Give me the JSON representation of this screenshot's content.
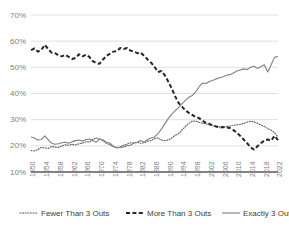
{
  "chart_data": {
    "type": "line",
    "title": "",
    "subtitle": "",
    "xlabel": "",
    "ylabel": "",
    "xlim": [
      1950,
      2022
    ],
    "ylim": [
      10,
      70
    ],
    "ytick_labels": [
      "70%",
      "60%",
      "50%",
      "40%",
      "30%",
      "20%",
      "10%"
    ],
    "ytick_values": [
      70,
      60,
      50,
      40,
      30,
      20,
      10
    ],
    "xtick_labels": [
      "1950",
      "1954",
      "1958",
      "1962",
      "1966",
      "1970",
      "1974",
      "1978",
      "1982",
      "1986",
      "1990",
      "1994",
      "1998",
      "2002",
      "2006",
      "2010",
      "2014",
      "2018",
      "2022"
    ],
    "xtick_values": [
      1950,
      1954,
      1958,
      1962,
      1966,
      1970,
      1974,
      1978,
      1982,
      1986,
      1990,
      1994,
      1998,
      2002,
      2006,
      2010,
      2014,
      2018,
      2022
    ],
    "grid": true,
    "legend_position": "bottom",
    "x": [
      1950,
      1951,
      1952,
      1953,
      1954,
      1955,
      1956,
      1957,
      1958,
      1959,
      1960,
      1961,
      1962,
      1963,
      1964,
      1965,
      1966,
      1967,
      1968,
      1969,
      1970,
      1971,
      1972,
      1973,
      1974,
      1975,
      1976,
      1977,
      1978,
      1979,
      1980,
      1981,
      1982,
      1983,
      1984,
      1985,
      1986,
      1987,
      1988,
      1989,
      1990,
      1991,
      1992,
      1993,
      1994,
      1995,
      1996,
      1997,
      1998,
      1999,
      2000,
      2001,
      2002,
      2003,
      2004,
      2005,
      2006,
      2007,
      2008,
      2009,
      2010,
      2011,
      2012,
      2013,
      2014,
      2015,
      2016,
      2017,
      2018,
      2019,
      2020,
      2021,
      2022
    ],
    "series": [
      {
        "name": "Fewer Than 3 Outs",
        "style": "dotted",
        "color": "#595959",
        "values": [
          18.2,
          18.0,
          18.6,
          19.4,
          19.2,
          19.0,
          19.8,
          19.5,
          19.4,
          20.0,
          20.4,
          20.2,
          20.6,
          20.3,
          20.8,
          21.0,
          21.6,
          21.4,
          22.4,
          23.0,
          22.6,
          22.0,
          21.0,
          20.4,
          19.6,
          19.4,
          19.5,
          20.2,
          20.6,
          21.2,
          21.0,
          21.4,
          21.0,
          21.2,
          21.8,
          22.0,
          22.8,
          23.0,
          22.2,
          22.0,
          22.2,
          23.0,
          24.0,
          24.6,
          26.0,
          27.4,
          28.6,
          29.4,
          29.5,
          29.0,
          28.6,
          28.4,
          28.0,
          27.6,
          27.4,
          27.2,
          27.0,
          27.4,
          27.6,
          27.8,
          28.0,
          28.2,
          28.6,
          29.0,
          29.4,
          29.2,
          28.6,
          28.0,
          27.4,
          26.6,
          26.0,
          25.0,
          23.4
        ]
      },
      {
        "name": "More Than 3 Outs",
        "style": "dashed",
        "color": "#262626",
        "values": [
          56.6,
          57.2,
          56.0,
          56.6,
          58.6,
          57.0,
          55.6,
          55.4,
          54.6,
          54.2,
          54.8,
          54.0,
          53.2,
          53.6,
          55.0,
          54.2,
          54.8,
          54.0,
          52.4,
          51.6,
          51.4,
          53.0,
          54.4,
          55.2,
          56.0,
          56.2,
          57.4,
          57.0,
          57.4,
          56.4,
          56.0,
          55.4,
          55.6,
          54.4,
          53.0,
          51.8,
          50.2,
          48.2,
          48.6,
          47.0,
          44.6,
          42.0,
          39.0,
          36.4,
          35.0,
          33.6,
          32.6,
          31.8,
          31.0,
          30.6,
          29.6,
          28.8,
          28.4,
          27.8,
          27.4,
          27.0,
          27.2,
          27.0,
          26.8,
          26.0,
          25.0,
          23.8,
          22.4,
          21.0,
          19.4,
          18.6,
          19.8,
          21.0,
          22.0,
          22.4,
          22.0,
          23.8,
          22.2
        ]
      },
      {
        "name": "Exactly 3 Outs",
        "style": "solid",
        "color": "#808080",
        "values": [
          23.4,
          23.0,
          22.2,
          22.4,
          23.8,
          22.4,
          21.0,
          20.6,
          20.8,
          21.2,
          21.4,
          21.0,
          21.6,
          22.0,
          22.2,
          21.8,
          22.4,
          22.6,
          22.0,
          21.4,
          22.6,
          22.2,
          21.4,
          21.0,
          19.8,
          19.2,
          19.4,
          19.6,
          20.0,
          20.2,
          21.2,
          21.4,
          22.0,
          21.4,
          22.4,
          23.0,
          23.4,
          24.6,
          26.4,
          28.4,
          30.4,
          32.0,
          33.4,
          34.6,
          36.0,
          37.4,
          38.6,
          39.2,
          40.6,
          42.6,
          44.0,
          43.8,
          44.6,
          45.0,
          45.6,
          46.0,
          46.4,
          47.0,
          47.2,
          47.8,
          48.6,
          49.0,
          49.4,
          49.2,
          50.0,
          50.4,
          49.6,
          50.2,
          51.0,
          48.2,
          51.0,
          53.8,
          54.2
        ]
      }
    ]
  },
  "legend": {
    "items": [
      {
        "label": "Fewer Than 3 Outs",
        "marker": "dotted-line-marker"
      },
      {
        "label": "More Than 3 Outs",
        "marker": "dashed-line-marker"
      },
      {
        "label": "Exactly 3 Outs",
        "marker": "solid-line-marker"
      }
    ]
  },
  "colors": {
    "grid": "#d9d9d9",
    "axis": "#595959",
    "tick_text": "#808080",
    "legend_text": "#404040",
    "background": "#ffffff"
  }
}
